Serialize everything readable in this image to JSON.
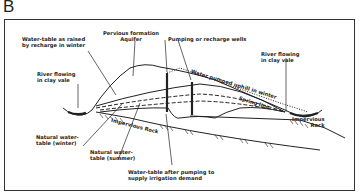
{
  "panel": {
    "letter": "B"
  },
  "labels": {
    "water_table_raised": "Water-table as raised\nby recharge in winter",
    "pervious_formation": "Pervious formation\nAquifer",
    "pumping_wells": "Pumping or recharge wells",
    "river_left": "River flowing\nin clay vale",
    "river_right": "River flowing\nin clay vale",
    "water_pumped_uphill": "Water pumped uphill in winter",
    "spring_line": "Spring line",
    "impervious_rock_center": "Impervious Rock",
    "impervious_rock_right": "Impervious\nRock",
    "natural_wt_winter": "Natural water-\ntable (winter)",
    "natural_wt_summer": "Natural water-\ntable (summer)",
    "wt_after_pumping": "Water-table after pumping to\nsupply irrigation demand"
  },
  "colors": {
    "ink": "#222222",
    "background": "#ffffff"
  }
}
